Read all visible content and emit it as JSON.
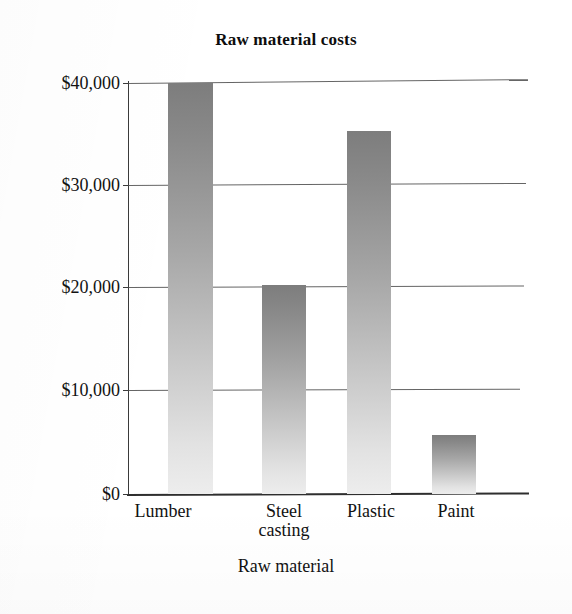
{
  "chart_data": {
    "type": "bar",
    "title": "Raw material costs",
    "xlabel": "Raw material",
    "ylabel": "",
    "categories": [
      "Lumber",
      "Steel casting",
      "Plastic",
      "Paint"
    ],
    "category_lines": [
      [
        "Lumber"
      ],
      [
        "Steel",
        "casting"
      ],
      [
        "Plastic"
      ],
      [
        "Paint"
      ]
    ],
    "values": [
      40000,
      20300,
      35300,
      5700
    ],
    "ylim": [
      0,
      40000
    ],
    "ytick_values": [
      0,
      10000,
      20000,
      30000,
      40000
    ],
    "ytick_labels": [
      "$0",
      "$10,000",
      "$20,000",
      "$30,000",
      "$40,000"
    ],
    "grid": "horizontal",
    "legend": "none",
    "bar_fill": "vertical gradient dark-gray to light-gray",
    "colors": {
      "bar_top": "#7d7d7d",
      "bar_bottom": "#ededed",
      "axis": "#2e2e2e",
      "gridline": "#4a4a4a",
      "text": "#121212",
      "background": "#ffffff"
    }
  }
}
